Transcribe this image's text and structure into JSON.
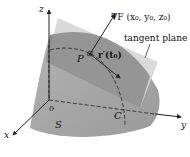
{
  "diagram": {
    "labels": {
      "z_axis": "z",
      "x_axis": "x",
      "y_axis": "y",
      "origin": "0",
      "surface": "S",
      "curve": "C",
      "point": "P",
      "gradient": "∇F (x₀, y₀, z₀)",
      "tangent_vector": "r′(t₀)",
      "tangent_plane": "tangent plane"
    },
    "colors": {
      "surface": "#a6a6a6",
      "surface_dark": "#8e8e8e",
      "plane": "#d4d4d4",
      "plane_over_surface": "#7d7d7d",
      "lines": "#222222",
      "background": "#ffffff"
    }
  }
}
